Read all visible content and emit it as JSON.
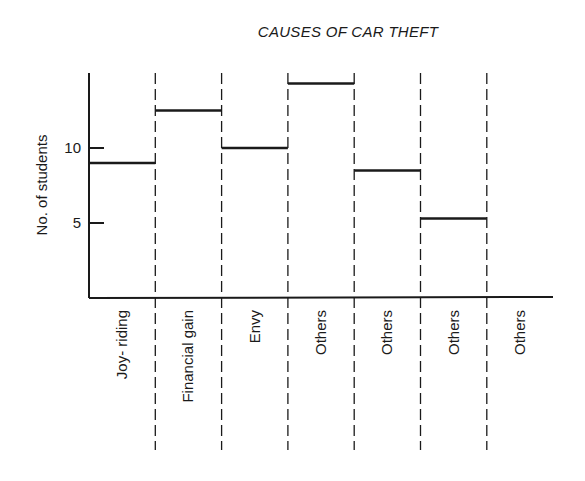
{
  "chart_data": {
    "type": "bar",
    "title": "CAUSES OF CAR THEFT",
    "xlabel": "",
    "ylabel": "No. of students",
    "categories": [
      "Joy- riding",
      "Financial gain",
      "Envy",
      "Others",
      "Others",
      "Others",
      "Others"
    ],
    "values": [
      9,
      12.5,
      10,
      14.3,
      8.5,
      5.3,
      null
    ],
    "yticks": [
      5,
      10
    ],
    "ylim": [
      0,
      15
    ],
    "grid": false,
    "legend": null,
    "style": "step-level bars with dashed category dividers"
  },
  "colors": {
    "ink": "#1a1a1a",
    "background": "#ffffff"
  }
}
